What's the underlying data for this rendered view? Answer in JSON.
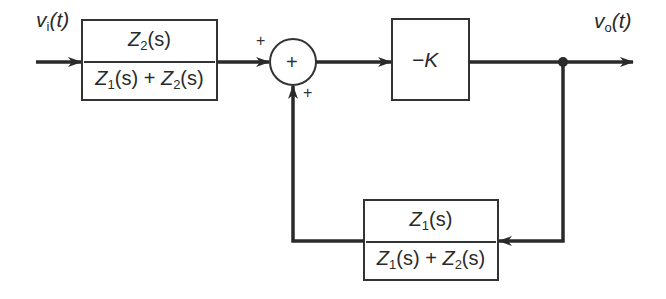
{
  "diagram": {
    "type": "block-diagram",
    "input": {
      "label_var": "v",
      "label_sub": "i",
      "label_arg": "(t)"
    },
    "output": {
      "label_var": "v",
      "label_sub": "o",
      "label_arg": "(t)"
    },
    "forward_block": {
      "numerator": {
        "var": "Z",
        "sub": "2",
        "arg": "(s)"
      },
      "denominator": {
        "a_var": "Z",
        "a_sub": "1",
        "a_arg": "(s)",
        "op": "+",
        "b_var": "Z",
        "b_sub": "2",
        "b_arg": "(s)"
      }
    },
    "summing_junction": {
      "symbol": "+",
      "input_sign_left": "+",
      "input_sign_bottom": "+"
    },
    "gain_block": {
      "label": "−K"
    },
    "feedback_block": {
      "numerator": {
        "var": "Z",
        "sub": "1",
        "arg": "(s)"
      },
      "denominator": {
        "a_var": "Z",
        "a_sub": "1",
        "a_arg": "(s)",
        "op": "+",
        "b_var": "Z",
        "b_sub": "2",
        "b_arg": "(s)"
      }
    },
    "colors": {
      "stroke": "#2a2a2a",
      "background": "#ffffff"
    }
  }
}
